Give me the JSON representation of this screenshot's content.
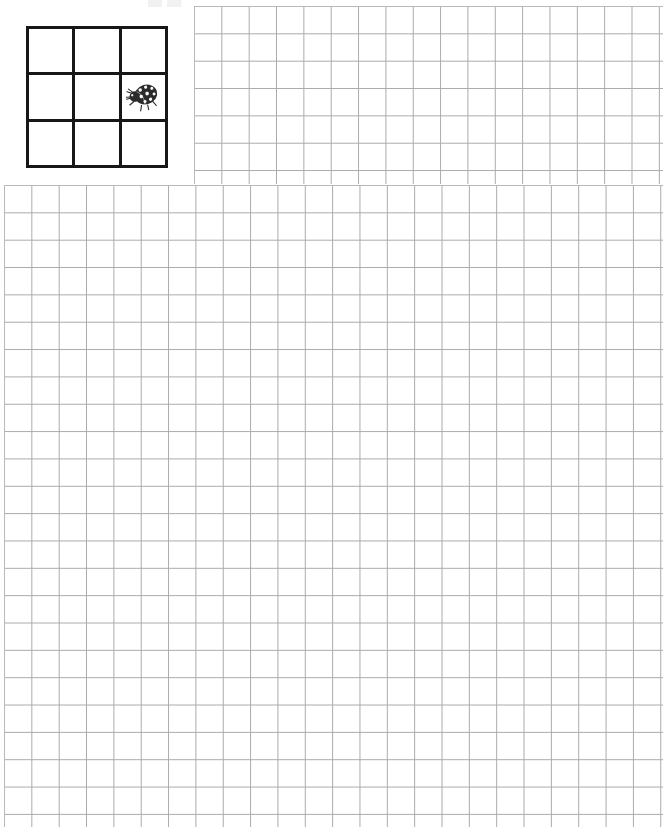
{
  "page": {
    "width": 672,
    "height": 833,
    "background_color": "#ffffff"
  },
  "artifact": {
    "name": "scan-artifact",
    "description": "faint cut-off text remnant at top edge"
  },
  "bug_grid": {
    "name": "ladybug-3x3-grid",
    "rows": 3,
    "columns": 3,
    "border_color": "#17171a",
    "border_width_px": 3,
    "cells": [
      {
        "row": 1,
        "col": 1,
        "content": ""
      },
      {
        "row": 1,
        "col": 2,
        "content": ""
      },
      {
        "row": 1,
        "col": 3,
        "content": ""
      },
      {
        "row": 2,
        "col": 1,
        "content": ""
      },
      {
        "row": 2,
        "col": 2,
        "content": ""
      },
      {
        "row": 2,
        "col": 3,
        "content": "ladybug-icon"
      },
      {
        "row": 3,
        "col": 1,
        "content": ""
      },
      {
        "row": 3,
        "col": 2,
        "content": ""
      },
      {
        "row": 3,
        "col": 3,
        "content": ""
      }
    ],
    "icon": {
      "name": "ladybug-icon",
      "label": "ladybug",
      "body_color": "#2b2b2b",
      "spot_color": "#ffffff"
    }
  },
  "grids": [
    {
      "name": "graph-grid-top-right",
      "columns": 17,
      "rows": 8,
      "cell_size_px": 27.35,
      "line_color": "#a9a9ae"
    },
    {
      "name": "graph-grid-main",
      "columns": 24,
      "rows": 23,
      "cell_size_px": 27.35,
      "line_color": "#a9a9ae"
    }
  ]
}
